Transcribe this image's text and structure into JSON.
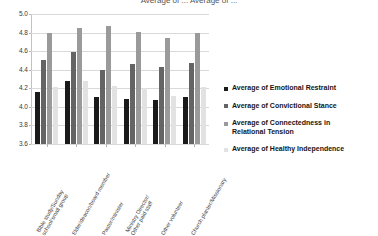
{
  "title": {
    "clipped_text": "Average of ... Average of ..."
  },
  "chart_data": {
    "type": "bar",
    "title": "",
    "xlabel": "",
    "ylabel": "",
    "ylim": [
      3.6,
      5.0
    ],
    "yticks": [
      "3.6",
      "3.8",
      "4.0",
      "4.2",
      "4.4",
      "4.6",
      "4.8",
      "5.0"
    ],
    "grid": true,
    "legend_position": "right",
    "categories": [
      "Bible study/Sunday school/small group",
      "Elder/deacon/board member",
      "Pastor/minister",
      "Ministry Director/Other paid staff",
      "Other volunteer",
      "Church planter/Missionary"
    ],
    "category_lines": [
      [
        "Bible study/Sunday",
        "school/small group"
      ],
      [
        "Elder/deacon/board member",
        ""
      ],
      [
        "Pastor/minister",
        ""
      ],
      [
        "Ministry Director/",
        "Other paid staff"
      ],
      [
        "Other volunteer",
        ""
      ],
      [
        "Church planter/Missionary",
        ""
      ]
    ],
    "series": [
      {
        "name": "Average of Emotional Restraint",
        "color": "#1a1a1a",
        "values": [
          4.16,
          4.28,
          4.11,
          4.08,
          4.07,
          4.11
        ]
      },
      {
        "name": "Average of Convictional Stance",
        "color": "#646464",
        "values": [
          4.5,
          4.59,
          4.4,
          4.46,
          4.43,
          4.47
        ]
      },
      {
        "name": "Average of Connectedness in Relational Tension",
        "color": "#9a9a9a",
        "values": [
          4.8,
          4.85,
          4.87,
          4.81,
          4.74,
          4.8
        ]
      },
      {
        "name": "Average of Healthy Independence",
        "color": "#e2e2e2",
        "values": [
          4.21,
          4.28,
          4.22,
          4.2,
          4.12,
          4.21
        ]
      }
    ]
  },
  "legend": {
    "items": [
      {
        "label": "Average of Emotional Restraint",
        "label2": "",
        "color": "#1a1a1a"
      },
      {
        "label": "Average of Convictional Stance",
        "label2": "",
        "color": "#646464"
      },
      {
        "label": "Average of Connectedness in",
        "label2": "Relational Tension",
        "color": "#9a9a9a"
      },
      {
        "label": "Average of Healthy Independence",
        "label2": "",
        "color": "#e2e2e2"
      }
    ]
  }
}
